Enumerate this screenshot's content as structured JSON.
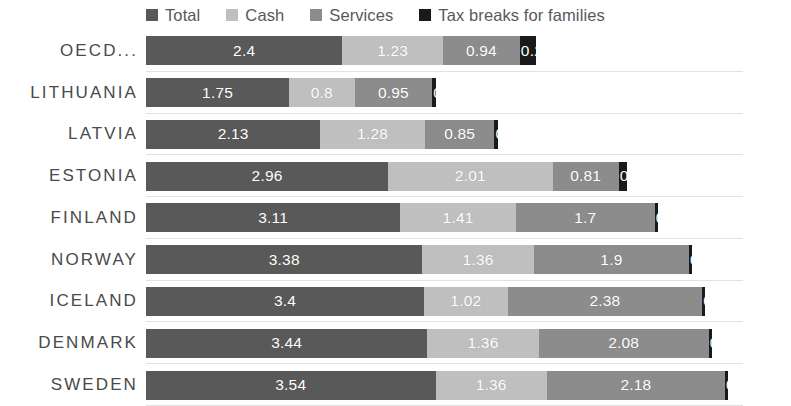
{
  "legend": {
    "position": "top",
    "items": [
      {
        "label": "Total",
        "color": "#595959",
        "swatch_name": "legend-swatch-total"
      },
      {
        "label": "Cash",
        "color": "#bfbfbf",
        "swatch_name": "legend-swatch-cash"
      },
      {
        "label": "Services",
        "color": "#8c8c8c",
        "swatch_name": "legend-swatch-services"
      },
      {
        "label": "Tax breaks for families",
        "color": "#1a1a1a",
        "swatch_name": "legend-swatch-tax-breaks"
      }
    ]
  },
  "axis": {
    "grid": true,
    "x_start_px": 146,
    "px_per_unit": 81.8
  },
  "chart_data": {
    "type": "bar",
    "orientation": "horizontal",
    "stacked": true,
    "title": "",
    "subtitle": "",
    "xlabel": "",
    "ylabel": "",
    "grid": true,
    "legend_position": "top",
    "categories": [
      "OECD...",
      "LITHUANIA",
      "LATVIA",
      "ESTONIA",
      "FINLAND",
      "NORWAY",
      "ICELAND",
      "DENMARK",
      "SWEDEN"
    ],
    "series": [
      {
        "name": "Total",
        "color": "#595959",
        "values": [
          2.4,
          1.75,
          2.13,
          2.96,
          3.11,
          3.38,
          3.4,
          3.44,
          3.54
        ]
      },
      {
        "name": "Cash",
        "color": "#bfbfbf",
        "values": [
          1.23,
          0.8,
          1.28,
          2.01,
          1.41,
          1.36,
          1.02,
          1.36,
          1.36
        ]
      },
      {
        "name": "Services",
        "color": "#8c8c8c",
        "values": [
          0.94,
          0.95,
          0.85,
          0.81,
          1.7,
          1.9,
          2.38,
          2.08,
          2.18
        ]
      },
      {
        "name": "Tax breaks for families",
        "color": "#1a1a1a",
        "values": [
          0.2,
          0.04,
          0.04,
          0.1,
          0.04,
          0.04,
          0.04,
          0.04,
          0.04
        ]
      }
    ],
    "data_labels": [
      {
        "category": "OECD...",
        "labels": [
          "2.4",
          "1.23",
          "0.94",
          "0.2"
        ]
      },
      {
        "category": "LITHUANIA",
        "labels": [
          "1.75",
          "0.8",
          "0.95",
          "0"
        ]
      },
      {
        "category": "LATVIA",
        "labels": [
          "2.13",
          "1.28",
          "0.85",
          "0"
        ]
      },
      {
        "category": "ESTONIA",
        "labels": [
          "2.96",
          "2.01",
          "0.81",
          "0.1"
        ]
      },
      {
        "category": "FINLAND",
        "labels": [
          "3.11",
          "1.41",
          "1.7",
          "0"
        ]
      },
      {
        "category": "NORWAY",
        "labels": [
          "3.38",
          "1.36",
          "1.9",
          "0"
        ]
      },
      {
        "category": "ICELAND",
        "labels": [
          "3.4",
          "1.02",
          "2.38",
          "0"
        ]
      },
      {
        "category": "DENMARK",
        "labels": [
          "3.44",
          "1.36",
          "2.08",
          "0"
        ]
      },
      {
        "category": "SWEDEN",
        "labels": [
          "3.54",
          "1.36",
          "2.18",
          "0"
        ]
      }
    ]
  }
}
